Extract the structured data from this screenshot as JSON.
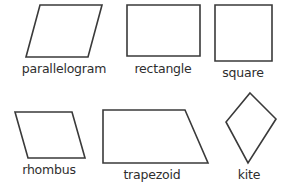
{
  "figure": {
    "background_color": "#ffffff",
    "stroke_color": "#3a3a3a",
    "label_color": "#2e2e2e",
    "width": 285,
    "height": 190
  },
  "shapes": [
    {
      "id": "parallelogram",
      "label": "parallelogram",
      "sides": 4,
      "vertices": [
        [
          40,
          5
        ],
        [
          102,
          5
        ],
        [
          88,
          57
        ],
        [
          26,
          57
        ]
      ],
      "label_x": 64,
      "label_y": 62
    },
    {
      "id": "rectangle",
      "label": "rectangle",
      "sides": 4,
      "vertices": [
        [
          127,
          5
        ],
        [
          200,
          5
        ],
        [
          200,
          56
        ],
        [
          127,
          56
        ]
      ],
      "label_x": 163,
      "label_y": 62
    },
    {
      "id": "square",
      "label": "square",
      "sides": 4,
      "vertices": [
        [
          215,
          5
        ],
        [
          272,
          5
        ],
        [
          272,
          61
        ],
        [
          215,
          61
        ]
      ],
      "label_x": 243,
      "label_y": 66
    },
    {
      "id": "rhombus",
      "label": "rhombus",
      "sides": 4,
      "vertices": [
        [
          15,
          112
        ],
        [
          72,
          112
        ],
        [
          85,
          158
        ],
        [
          28,
          158
        ]
      ],
      "label_x": 49,
      "label_y": 163
    },
    {
      "id": "trapezoid",
      "label": "trapezoid",
      "sides": 4,
      "vertices": [
        [
          103,
          110
        ],
        [
          185,
          110
        ],
        [
          208,
          163
        ],
        [
          103,
          163
        ]
      ],
      "label_x": 152,
      "label_y": 168
    },
    {
      "id": "kite",
      "label": "kite",
      "sides": 4,
      "vertices": [
        [
          250,
          93
        ],
        [
          276,
          119
        ],
        [
          248,
          163
        ],
        [
          226,
          122
        ]
      ],
      "label_x": 249,
      "label_y": 168
    }
  ]
}
